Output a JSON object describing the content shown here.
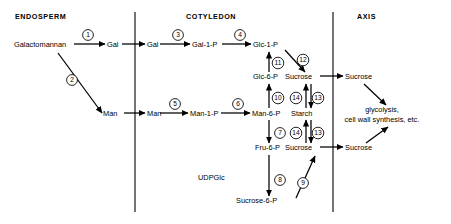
{
  "figure": {
    "background_color": "#ffffff",
    "line_color": "#000000",
    "width": 451,
    "height": 224
  },
  "compartments": [
    {
      "id": "endosperm",
      "label": "ENDOSPERM",
      "label_x": 15,
      "label_y": 19
    },
    {
      "id": "cotyledon",
      "label": "COTYLEDON",
      "label_x": 186,
      "label_y": 19
    },
    {
      "id": "axis",
      "label": "AXIS",
      "label_x": 357,
      "label_y": 19
    }
  ],
  "dividers": [
    {
      "name": "endosperm-cotyledon-divider",
      "x": 135,
      "y1": 12,
      "y2": 212
    },
    {
      "name": "cotyledon-axis-divider",
      "x": 333,
      "y1": 12,
      "y2": 212
    }
  ],
  "metabolites": [
    {
      "id": "galactomannan",
      "label": "Galactomannan",
      "x": 14,
      "y": 47,
      "anchor": "start",
      "compartment": "endosperm"
    },
    {
      "id": "gal-endo",
      "label": "Gal",
      "x": 107,
      "y": 47,
      "anchor": "start",
      "compartment": "endosperm"
    },
    {
      "id": "man-endo",
      "label": "Man",
      "x": 103,
      "y": 116,
      "anchor": "start",
      "compartment": "endosperm"
    },
    {
      "id": "gal-cot",
      "label": "Gal",
      "x": 147,
      "y": 47,
      "anchor": "start",
      "compartment": "cotyledon"
    },
    {
      "id": "gal-1-p",
      "label": "Gal-1-P",
      "x": 192,
      "y": 47,
      "anchor": "start",
      "compartment": "cotyledon"
    },
    {
      "id": "glc-1-p",
      "label": "Glc-1-P",
      "x": 253,
      "y": 47,
      "anchor": "start",
      "compartment": "cotyledon"
    },
    {
      "id": "glc-6-p",
      "label": "Glc-6-P",
      "x": 253,
      "y": 79,
      "anchor": "start",
      "compartment": "cotyledon"
    },
    {
      "id": "man-cot",
      "label": "Man",
      "x": 147,
      "y": 116,
      "anchor": "start",
      "compartment": "cotyledon"
    },
    {
      "id": "man-1-p",
      "label": "Man-1-P",
      "x": 190,
      "y": 116,
      "anchor": "start",
      "compartment": "cotyledon"
    },
    {
      "id": "man-6-p",
      "label": "Man-6-P",
      "x": 252,
      "y": 116,
      "anchor": "start",
      "compartment": "cotyledon"
    },
    {
      "id": "fru-6-p",
      "label": "Fru-6-P",
      "x": 255,
      "y": 150,
      "anchor": "start",
      "compartment": "cotyledon"
    },
    {
      "id": "udpglc",
      "label": "UDPGlc",
      "x": 198,
      "y": 180,
      "anchor": "start",
      "compartment": "cotyledon"
    },
    {
      "id": "sucrose-6-p",
      "label": "Sucrose-6-P",
      "x": 236,
      "y": 203,
      "anchor": "start",
      "compartment": "cotyledon"
    },
    {
      "id": "sucrose-cot-top",
      "label": "Sucrose",
      "x": 285,
      "y": 79,
      "anchor": "start",
      "compartment": "cotyledon"
    },
    {
      "id": "starch-cot",
      "label": "Starch",
      "x": 291,
      "y": 116,
      "anchor": "start",
      "compartment": "cotyledon"
    },
    {
      "id": "sucrose-cot-bottom",
      "label": "Sucrose",
      "x": 285,
      "y": 150,
      "anchor": "start",
      "compartment": "cotyledon"
    },
    {
      "id": "sucrose-axis-top",
      "label": "Sucrose",
      "x": 345,
      "y": 79,
      "anchor": "start",
      "compartment": "axis"
    },
    {
      "id": "sucrose-axis-bottom",
      "label": "Sucrose",
      "x": 345,
      "y": 150,
      "anchor": "start",
      "compartment": "axis"
    }
  ],
  "fate_text": {
    "id": "glycolysis-fate",
    "lines": [
      "glycolysis,",
      "cell wall synthesis, etc."
    ],
    "line1_x": 382,
    "line1_y": 112,
    "line2_x": 382,
    "line2_y": 122,
    "anchor": "middle"
  },
  "steps": [
    {
      "n": "1",
      "cx": 88,
      "cy": 35,
      "r": 5.4
    },
    {
      "n": "2",
      "cx": 72,
      "cy": 80,
      "r": 5.4
    },
    {
      "n": "3",
      "cx": 178,
      "cy": 35,
      "r": 5.4
    },
    {
      "n": "4",
      "cx": 240,
      "cy": 35,
      "r": 5.4
    },
    {
      "n": "5",
      "cx": 175,
      "cy": 104,
      "r": 5.4
    },
    {
      "n": "6",
      "cx": 238,
      "cy": 104,
      "r": 5.4
    },
    {
      "n": "7",
      "cx": 280,
      "cy": 133,
      "r": 5.4
    },
    {
      "n": "8",
      "cx": 280,
      "cy": 180,
      "r": 5.4
    },
    {
      "n": "9",
      "cx": 303,
      "cy": 183,
      "r": 5.4
    },
    {
      "n": "10",
      "cx": 278,
      "cy": 98,
      "r": 5.8
    },
    {
      "n": "11",
      "cx": 278,
      "cy": 63,
      "r": 5.8
    },
    {
      "n": "12",
      "cx": 303,
      "cy": 60,
      "r": 5.8
    },
    {
      "n": "13",
      "cx": 318,
      "cy": 98,
      "r": 5.8
    },
    {
      "n": "14",
      "cx": 296,
      "cy": 98,
      "r": 5.8
    },
    {
      "n": "13",
      "cx": 318,
      "cy": 133,
      "r": 5.8
    },
    {
      "n": "14",
      "cx": 296,
      "cy": 133,
      "r": 5.8
    }
  ],
  "arrows": [
    {
      "name": "galactomannan-to-gal-endosperm",
      "x1": 74,
      "y1": 44,
      "x2": 105,
      "y2": 44
    },
    {
      "name": "galactomannan-to-man-endosperm",
      "x1": 58,
      "y1": 53,
      "x2": 102,
      "y2": 113
    },
    {
      "name": "gal-endosperm-to-gal-cotyledon",
      "x1": 122,
      "y1": 44,
      "x2": 145,
      "y2": 44
    },
    {
      "name": "man-endosperm-to-man-cotyledon",
      "x1": 124,
      "y1": 113,
      "x2": 145,
      "y2": 113
    },
    {
      "name": "gal-to-gal-1-p",
      "x1": 160,
      "y1": 44,
      "x2": 190,
      "y2": 44
    },
    {
      "name": "gal-1-p-to-glc-1-p",
      "x1": 222,
      "y1": 44,
      "x2": 251,
      "y2": 44
    },
    {
      "name": "man-to-man-1-p",
      "x1": 160,
      "y1": 113,
      "x2": 188,
      "y2": 113
    },
    {
      "name": "man-1-p-to-man-6-p",
      "x1": 221,
      "y1": 113,
      "x2": 250,
      "y2": 113
    },
    {
      "name": "man-6-p-to-glc-6-p",
      "x1": 269,
      "y1": 108,
      "x2": 269,
      "y2": 84
    },
    {
      "name": "glc-6-p-to-glc-1-p",
      "x1": 269,
      "y1": 72,
      "x2": 269,
      "y2": 52
    },
    {
      "name": "glc-1-p-to-sucrose-cotyledon",
      "x1": 285,
      "y1": 50,
      "x2": 305,
      "y2": 72
    },
    {
      "name": "man-6-p-to-fru-6-p",
      "x1": 269,
      "y1": 120,
      "x2": 269,
      "y2": 143
    },
    {
      "name": "fru-6-p-to-sucrose-6-p",
      "x1": 269,
      "y1": 155,
      "x2": 269,
      "y2": 196
    },
    {
      "name": "sucrose-6-p-to-sucrose-cotyledon",
      "x1": 296,
      "y1": 198,
      "x2": 315,
      "y2": 156
    },
    {
      "name": "sucrose-cot-top-to-axis",
      "x1": 320,
      "y1": 76,
      "x2": 343,
      "y2": 76
    },
    {
      "name": "sucrose-cot-bottom-to-axis",
      "x1": 320,
      "y1": 147,
      "x2": 343,
      "y2": 147
    },
    {
      "name": "sucrose-axis-top-to-fate",
      "x1": 364,
      "y1": 84,
      "x2": 386,
      "y2": 105
    },
    {
      "name": "sucrose-axis-bottom-to-fate",
      "x1": 366,
      "y1": 143,
      "x2": 388,
      "y2": 127
    }
  ],
  "reversible_pairs": [
    {
      "name": "sucrose-starch-upper",
      "up_x": 306,
      "down_x": 311,
      "y_top": 84,
      "y_bottom": 108
    },
    {
      "name": "sucrose-starch-lower",
      "up_x": 306,
      "down_x": 311,
      "y_top": 120,
      "y_bottom": 143
    }
  ]
}
